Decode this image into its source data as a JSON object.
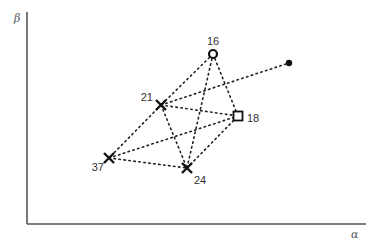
{
  "diagram": {
    "axes": {
      "x_label": "α",
      "y_label": "β",
      "origin": [
        27,
        224
      ],
      "x_end": 366,
      "y_end": 12
    },
    "nodes": [
      {
        "id": "16",
        "label": "16",
        "marker": "circle",
        "x": 213,
        "y": 54,
        "label_x": 213,
        "label_y": 45,
        "anchor": "middle"
      },
      {
        "id": "21",
        "label": "21",
        "marker": "cross",
        "x": 161,
        "y": 105,
        "label_x": 153,
        "label_y": 101,
        "anchor": "end"
      },
      {
        "id": "18",
        "label": "18",
        "marker": "square",
        "x": 238,
        "y": 116,
        "label_x": 247,
        "label_y": 122,
        "anchor": "start"
      },
      {
        "id": "37",
        "label": "37",
        "marker": "cross",
        "x": 109,
        "y": 158,
        "label_x": 104,
        "label_y": 171,
        "anchor": "end"
      },
      {
        "id": "24",
        "label": "24",
        "marker": "cross",
        "x": 187,
        "y": 168,
        "label_x": 194,
        "label_y": 184,
        "anchor": "start"
      },
      {
        "id": "target",
        "label": "",
        "marker": "dot",
        "x": 289,
        "y": 63
      }
    ],
    "edges": [
      [
        "16",
        "21"
      ],
      [
        "16",
        "18"
      ],
      [
        "16",
        "24"
      ],
      [
        "21",
        "37"
      ],
      [
        "21",
        "18"
      ],
      [
        "21",
        "24"
      ],
      [
        "21",
        "target"
      ],
      [
        "37",
        "24"
      ],
      [
        "37",
        "18"
      ],
      [
        "24",
        "18"
      ]
    ]
  }
}
